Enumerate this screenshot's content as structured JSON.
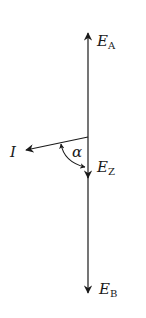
{
  "diagram": {
    "vectors": [
      {
        "id": "EA",
        "label": "E",
        "subscript": "A",
        "direction": "up"
      },
      {
        "id": "EZ",
        "label": "E",
        "subscript": "Z",
        "direction": "down"
      },
      {
        "id": "EB",
        "label": "E",
        "subscript": "B",
        "direction": "down"
      },
      {
        "id": "I",
        "label": "I",
        "direction": "left-down"
      }
    ],
    "angle": {
      "label": "α",
      "between": [
        "I",
        "EZ"
      ]
    },
    "colors": {
      "stroke": "#1a1a1a",
      "background": "#ffffff"
    }
  }
}
